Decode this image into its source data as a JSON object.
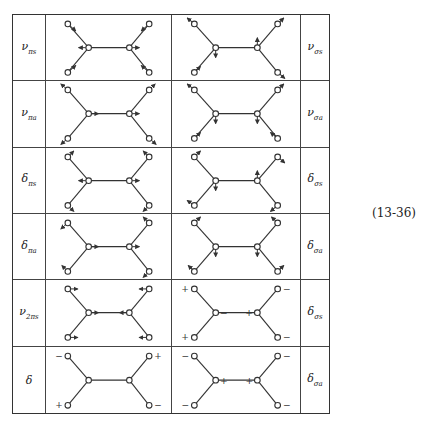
{
  "equation_number": "(13-36)",
  "colors": {
    "line": "#333333",
    "background": "#ffffff"
  },
  "atoms": {
    "outer_tl": [
      22,
      9
    ],
    "outer_tr": [
      104,
      9
    ],
    "outer_bl": [
      22,
      58
    ],
    "outer_br": [
      104,
      58
    ],
    "center_l": [
      43,
      33
    ],
    "center_r": [
      84,
      33
    ]
  },
  "rows": [
    {
      "left": {
        "label": "ν",
        "sub": "πs",
        "arrows": [
          [
            "outer_tl",
            8,
            7
          ],
          [
            "outer_tr",
            -8,
            7
          ],
          [
            "outer_bl",
            8,
            -7
          ],
          [
            "outer_br",
            -8,
            -7
          ],
          [
            "center_l",
            -10,
            0
          ],
          [
            "center_r",
            10,
            0
          ]
        ],
        "signs": []
      },
      "right": {
        "label": "ν",
        "sub": "σs",
        "arrows": [
          [
            "outer_tl",
            -7,
            -6
          ],
          [
            "outer_tr",
            6,
            -6
          ],
          [
            "outer_bl",
            6,
            -6
          ],
          [
            "outer_br",
            7,
            6
          ],
          [
            "center_l",
            0,
            10
          ],
          [
            "center_r",
            0,
            -10
          ]
        ],
        "signs": []
      }
    },
    {
      "left": {
        "label": "ν",
        "sub": "πa",
        "arrows": [
          [
            "outer_tl",
            -7,
            -6
          ],
          [
            "outer_tr",
            6,
            -6
          ],
          [
            "outer_bl",
            -7,
            6
          ],
          [
            "outer_br",
            7,
            6
          ],
          [
            "center_l",
            10,
            0
          ],
          [
            "center_r",
            10,
            0
          ]
        ],
        "signs": []
      },
      "right": {
        "label": "ν",
        "sub": "σa",
        "arrows": [
          [
            "outer_tl",
            -7,
            -6
          ],
          [
            "outer_tr",
            6,
            -6
          ],
          [
            "outer_bl",
            6,
            -6
          ],
          [
            "outer_br",
            -7,
            -6
          ],
          [
            "center_l",
            0,
            10
          ],
          [
            "center_r",
            0,
            10
          ]
        ],
        "signs": []
      }
    },
    {
      "left": {
        "label": "δ",
        "sub": "πs",
        "arrows": [
          [
            "outer_tl",
            6,
            -6
          ],
          [
            "outer_tr",
            -6,
            -6
          ],
          [
            "outer_bl",
            6,
            6
          ],
          [
            "outer_br",
            -6,
            6
          ],
          [
            "center_l",
            -10,
            0
          ],
          [
            "center_r",
            10,
            0
          ]
        ],
        "signs": []
      },
      "right": {
        "label": "δ",
        "sub": "σs",
        "arrows": [
          [
            "outer_tl",
            6,
            -6
          ],
          [
            "outer_tr",
            7,
            6
          ],
          [
            "outer_bl",
            -7,
            -5
          ],
          [
            "outer_br",
            -7,
            6
          ],
          [
            "center_l",
            0,
            10
          ],
          [
            "center_r",
            0,
            -10
          ]
        ],
        "signs": []
      }
    },
    {
      "left": {
        "label": "δ",
        "sub": "πa",
        "arrows": [
          [
            "outer_tl",
            -7,
            6
          ],
          [
            "outer_tr",
            -6,
            -6
          ],
          [
            "outer_bl",
            -6,
            -6
          ],
          [
            "outer_br",
            -6,
            6
          ],
          [
            "center_l",
            10,
            0
          ],
          [
            "center_r",
            10,
            0
          ]
        ],
        "signs": []
      },
      "right": {
        "label": "δ",
        "sub": "σa",
        "arrows": [
          [
            "outer_tl",
            6,
            -6
          ],
          [
            "outer_tr",
            -6,
            -6
          ],
          [
            "outer_bl",
            -6,
            -6
          ],
          [
            "outer_br",
            6,
            -6
          ],
          [
            "center_l",
            0,
            10
          ],
          [
            "center_r",
            0,
            10
          ]
        ],
        "signs": []
      }
    },
    {
      "left": {
        "label": "ν",
        "sub": "2πs",
        "arrows": [
          [
            "outer_tl",
            10,
            0
          ],
          [
            "outer_tr",
            -10,
            0
          ],
          [
            "outer_bl",
            10,
            0
          ],
          [
            "outer_br",
            -10,
            0
          ],
          [
            "center_l",
            10,
            0
          ],
          [
            "center_r",
            -10,
            0
          ]
        ],
        "signs": []
      },
      "right": {
        "label": "δ",
        "sub": "σs",
        "arrows": [],
        "signs": [
          [
            "outer_tl",
            "+",
            -9,
            2
          ],
          [
            "outer_tr",
            "−",
            9,
            2
          ],
          [
            "outer_bl",
            "+",
            -9,
            2
          ],
          [
            "outer_br",
            "−",
            9,
            2
          ],
          [
            "center_l",
            "−",
            8,
            2
          ],
          [
            "center_r",
            "+",
            -8,
            2
          ]
        ]
      }
    },
    {
      "left": {
        "label": "δ",
        "sub": "",
        "arrows": [],
        "signs": [
          [
            "outer_tl",
            "−",
            -9,
            2
          ],
          [
            "outer_tr",
            "+",
            9,
            2
          ],
          [
            "outer_bl",
            "+",
            -9,
            2
          ],
          [
            "outer_br",
            "−",
            9,
            2
          ]
        ]
      },
      "right": {
        "label": "δ",
        "sub": "σa",
        "arrows": [],
        "signs": [
          [
            "outer_tl",
            "−",
            -9,
            2
          ],
          [
            "outer_tr",
            "−",
            9,
            2
          ],
          [
            "outer_bl",
            "−",
            -9,
            2
          ],
          [
            "outer_br",
            "−",
            9,
            2
          ],
          [
            "center_l",
            "+",
            8,
            3
          ],
          [
            "center_r",
            "+",
            -8,
            3
          ]
        ]
      }
    }
  ]
}
